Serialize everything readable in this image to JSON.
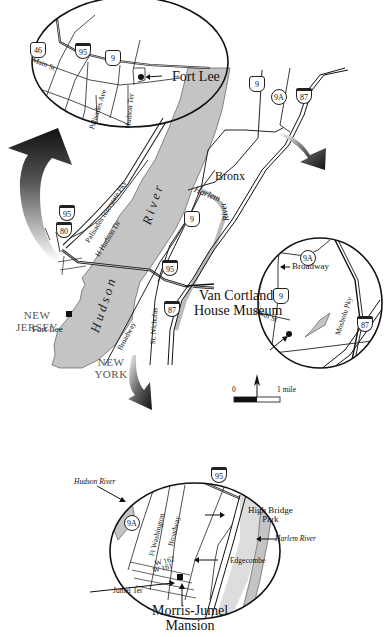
{
  "map": {
    "title_places": {
      "fort_lee_inset": "Fort Lee",
      "fort_lee_main": "Fort Lee",
      "bronx": "Bronx",
      "van_cortlandt": "Van Cortlandt",
      "van_cortlandt_2": "House Museum",
      "morris_jumel": "Morris-Jumel",
      "morris_jumel_2": "Mansion",
      "new_jersey_1": "NEW",
      "new_jersey_2": "JERSEY",
      "new_york_1": "NEW",
      "new_york_2": "YORK"
    },
    "rivers": {
      "hudson": "Hudson",
      "river": "River",
      "harlem": "Harlem",
      "harlem_river_word": "River",
      "hudson_river_inset": "Hudson River",
      "harlem_river_inset": "Harlem River"
    },
    "streets": {
      "main_st": "Main St",
      "palisades_ave": "Palisades Ave",
      "hudson_ter": "Hudson Ter",
      "palisades_pky": "Palisades Interstate Pky",
      "hudson_dr": "H Hudson Dr",
      "broadway_main": "Broadway",
      "st_nicholas": "St. Nicholas",
      "broadway_vc": "Broadway",
      "st_246": "246th St",
      "mosholu": "Mosholu Pky",
      "ft_washington": "Ft Washington",
      "broadway_mj": "Broadway",
      "w162": "W 162",
      "w161": "W 161",
      "jumel_ter": "Jumel Ter",
      "high_bridge_1": "High Bridge",
      "high_bridge_2": "Park",
      "edgecombe": "Edgecombe"
    },
    "shields": {
      "inset_fl_46": "46",
      "inset_fl_95": "95",
      "inset_fl_9": "9",
      "main_9_top": "9",
      "main_9a_top": "9A",
      "main_87_top": "87",
      "main_95_left": "95",
      "main_80": "80",
      "main_9_mid": "9",
      "main_95_mid": "95",
      "main_87_low": "87",
      "vc_9a": "9A",
      "vc_9": "9",
      "vc_87": "87",
      "mj_95": "95",
      "mj_9a": "9A"
    },
    "scale": {
      "zero": "0",
      "one": "1 mile"
    },
    "colors": {
      "water": "#c4c4c4",
      "road": "#1a1a1a",
      "background": "#ffffff",
      "arrow": "#111111"
    }
  }
}
